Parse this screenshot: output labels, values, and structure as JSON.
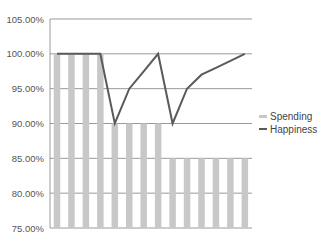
{
  "chart_data": {
    "type": "bar+line",
    "title": "",
    "xlabel": "",
    "ylabel": "",
    "ylim": [
      0.75,
      1.05
    ],
    "yticks": [
      "105.00%",
      "100.00%",
      "95.00%",
      "90.00%",
      "85.00%",
      "80.00%",
      "75.00%"
    ],
    "ytick_values": [
      1.05,
      1.0,
      0.95,
      0.9,
      0.85,
      0.8,
      0.75
    ],
    "grid": true,
    "legend_position": "right",
    "categories": [
      1,
      2,
      3,
      4,
      5,
      6,
      7,
      8,
      9,
      10,
      11,
      12,
      13,
      14
    ],
    "series": [
      {
        "name": "Spending",
        "type": "bar",
        "color": "#c8c8c8",
        "values": [
          1.0,
          1.0,
          1.0,
          1.0,
          0.9,
          0.9,
          0.9,
          0.9,
          0.85,
          0.85,
          0.85,
          0.85,
          0.85,
          0.85
        ]
      },
      {
        "name": "Happiness",
        "type": "line",
        "color": "#5a5a5a",
        "values": [
          1.0,
          1.0,
          1.0,
          1.0,
          0.9,
          0.95,
          0.975,
          1.0,
          0.9,
          0.95,
          0.97,
          0.98,
          0.99,
          1.0
        ]
      }
    ]
  },
  "legend": {
    "spending_label": "Spending",
    "happiness_label": "Happiness"
  }
}
